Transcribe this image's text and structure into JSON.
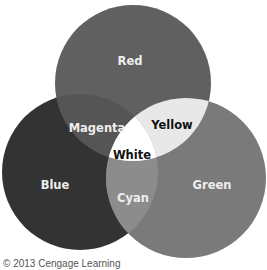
{
  "diagram": {
    "type": "venn-additive-color",
    "circles": [
      {
        "name": "Red",
        "cx": 133,
        "cy": 83,
        "r": 78,
        "fill": "#606060"
      },
      {
        "name": "Blue",
        "cx": 80,
        "cy": 172,
        "r": 78,
        "fill": "#333333"
      },
      {
        "name": "Green",
        "cx": 186,
        "cy": 178,
        "r": 80,
        "fill": "#7a7a7a"
      }
    ],
    "regions": {
      "magenta_fill": "#555555",
      "yellow_fill": "#e8e8e8",
      "cyan_fill": "#8c8c8c",
      "white_fill": "#ffffff"
    },
    "labels": {
      "red": "Red",
      "magenta": "Magenta",
      "yellow": "Yellow",
      "white": "White",
      "blue": "Blue",
      "cyan": "Cyan",
      "green": "Green"
    },
    "label_colors": {
      "light": "#eeeeee",
      "dark": "#111111"
    }
  },
  "copyright": "© 2013 Cengage Learning"
}
